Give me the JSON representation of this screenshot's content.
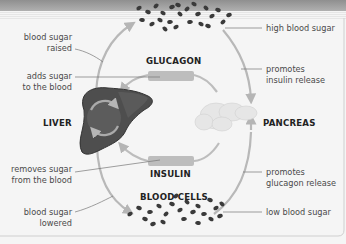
{
  "diagram": {
    "colors": {
      "background": "#f5f5f5",
      "top_band": "#9a9a9a",
      "arrow": "#b8b8b8",
      "hormone_box": "#bdbdbd",
      "liver": "#505050",
      "cells": "#3a3a3a",
      "pancreas": "#e6e6e6"
    },
    "organs": {
      "liver": "LIVER",
      "pancreas": "PANCREAS",
      "blood_cells": "BLOOD CELLS"
    },
    "hormones": {
      "glucagon": "GLUCAGON",
      "insulin": "INSULIN"
    },
    "left_labels": {
      "blood_sugar_raised": [
        "blood sugar",
        "raised"
      ],
      "adds_sugar": [
        "adds sugar",
        "to the blood"
      ],
      "removes_sugar": [
        "removes sugar",
        "from the blood"
      ],
      "blood_sugar_lowered": [
        "blood sugar",
        "lowered"
      ]
    },
    "right_labels": {
      "high_blood_sugar": "high blood sugar",
      "promotes_insulin": [
        "promotes",
        "insulin release"
      ],
      "promotes_glucagon": [
        "promotes",
        "glucagon release"
      ],
      "low_blood_sugar": "low blood sugar"
    }
  }
}
